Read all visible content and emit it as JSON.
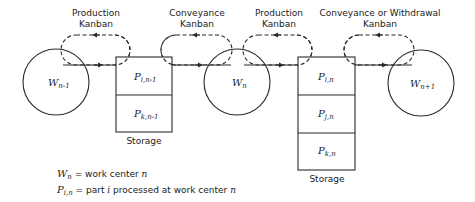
{
  "diagram": {
    "kanban_labels": [
      {
        "line1": "Production",
        "line2": "Kanban",
        "x": 96
      },
      {
        "line1": "Conveyance",
        "line2": "Kanban",
        "x": 197
      },
      {
        "line1": "Production",
        "line2": "Kanban",
        "x": 279
      },
      {
        "line1": "Conveyance or Withdrawal",
        "line2": "Kanban",
        "x": 380
      }
    ],
    "work_centers": [
      {
        "symbol": "W",
        "subscript": "n-1",
        "cx": 56,
        "cy": 82
      },
      {
        "symbol": "W",
        "subscript": "n",
        "cx": 237,
        "cy": 82
      },
      {
        "symbol": "W",
        "subscript": "n+1",
        "cx": 421,
        "cy": 83
      }
    ],
    "storages": [
      {
        "label": "Storage",
        "cells": [
          {
            "symbol": "P",
            "subscript": "i,n-1"
          },
          {
            "symbol": "P",
            "subscript": "k,n-1"
          }
        ]
      },
      {
        "label": "Storage",
        "cells": [
          {
            "symbol": "P",
            "subscript": "i,n"
          },
          {
            "symbol": "P",
            "subscript": "j,n"
          },
          {
            "symbol": "P",
            "subscript": "k,n"
          }
        ]
      }
    ],
    "legend": [
      {
        "symbol": "W",
        "subscript": "n",
        "text": " = work center ",
        "tail_italic": "n"
      },
      {
        "symbol": "P",
        "subscript": "i,n",
        "text": " = part ",
        "mid_italic": "i",
        "text2": " processed at work center ",
        "tail_italic": "n"
      }
    ]
  }
}
